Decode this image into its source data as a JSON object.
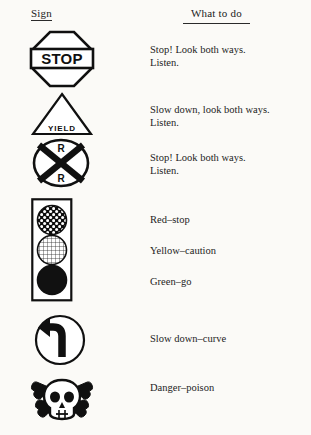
{
  "page": {
    "background_color": "#fbfaf7",
    "ink_color": "#1b1b1b"
  },
  "headers": {
    "left": "Sign",
    "right": "What to do"
  },
  "rows": [
    {
      "sign_name": "stop-sign",
      "sign_label": "STOP",
      "sign_shape": "octagon",
      "description": "Stop! Look both ways.\nListen."
    },
    {
      "sign_name": "yield-sign",
      "sign_label": "YIELD",
      "sign_shape": "triangle",
      "description": "Slow down, look both ways.\nListen."
    },
    {
      "sign_name": "railroad-crossing-sign",
      "sign_label": "R R",
      "sign_shape": "circle-crossbuck",
      "description": "Stop! Look both ways.\nListen."
    },
    {
      "sign_name": "traffic-light",
      "sign_label": "",
      "sign_shape": "rectangle-three-lights",
      "lights": [
        {
          "name": "red-light",
          "pattern": "coarse-checker",
          "text": "Red–stop"
        },
        {
          "name": "yellow-light",
          "pattern": "fine-hatch",
          "text": "Yellow–caution"
        },
        {
          "name": "green-light",
          "pattern": "solid-dark",
          "text": "Green–go"
        }
      ]
    },
    {
      "sign_name": "curve-sign",
      "sign_label": "",
      "sign_shape": "circle-arrow",
      "description": "Slow down–curve"
    },
    {
      "sign_name": "poison-sign",
      "sign_label": "",
      "sign_shape": "skull-and-crossbones",
      "description": "Danger–poison"
    }
  ]
}
